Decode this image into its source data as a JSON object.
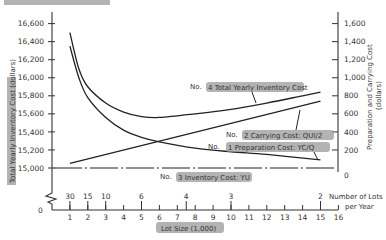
{
  "chart_data": {
    "type": "line",
    "title": "",
    "xlabel": "Lot Size (1,000)",
    "ylabel_left": "Total Yearly Inventory Cost (dollars)",
    "ylabel_right": "Preparation and Carrying Cost (dollars)",
    "x_ticks": [
      1,
      2,
      3,
      4,
      5,
      6,
      7,
      8,
      9,
      10,
      11,
      12,
      13,
      14,
      15,
      16
    ],
    "x_zero_label": "0",
    "secondary_x_label": "Number of Lots per Year",
    "secondary_x_label_line1": "Number of Lots",
    "secondary_x_label_line2": "per Year",
    "secondary_x_ticks": [
      {
        "at": 1,
        "label": "30"
      },
      {
        "at": 2,
        "label": "15"
      },
      {
        "at": 3,
        "label": "10"
      },
      {
        "at": 5,
        "label": "6"
      },
      {
        "at": 7.5,
        "label": "4"
      },
      {
        "at": 10,
        "label": "3"
      },
      {
        "at": 15,
        "label": "2"
      }
    ],
    "y_left_ticks": [
      "15,000",
      "15,200",
      "15,400",
      "15,600",
      "15,800",
      "16,000",
      "16,200",
      "16,400",
      "16,600"
    ],
    "y_left_range": [
      15000,
      16600
    ],
    "y_right_ticks": [
      "0",
      "200",
      "400",
      "600",
      "800",
      "1,000",
      "1,200",
      "1,400",
      "1,600"
    ],
    "y_right_range": [
      0,
      1600
    ],
    "series": [
      {
        "name": "No. 4 Total Yearly Inventory Cost",
        "axis": "left",
        "x": [
          1,
          1.5,
          2,
          3,
          4,
          5,
          6,
          8,
          10,
          12,
          14,
          15
        ],
        "values": [
          16500,
          16100,
          15900,
          15720,
          15620,
          15570,
          15560,
          15600,
          15650,
          15720,
          15800,
          15840
        ]
      },
      {
        "name": "No. 2 Carrying Cost: QUI/2",
        "axis": "right",
        "x": [
          1,
          15
        ],
        "values": [
          50,
          740
        ]
      },
      {
        "name": "No. 1 Preparation Cost: YC/Q",
        "axis": "right",
        "x": [
          1,
          1.5,
          2,
          3,
          4,
          5,
          6,
          8,
          10,
          12,
          15
        ],
        "values": [
          1350,
          1000,
          780,
          560,
          420,
          340,
          290,
          220,
          180,
          150,
          90
        ]
      },
      {
        "name": "No. 3 Inventory Cost: YU",
        "axis": "left",
        "x": [
          0,
          16
        ],
        "values": [
          15000,
          15000
        ]
      }
    ],
    "annotations": [
      "No. 4 Total Yearly Inventory Cost",
      "No. 2 Carrying Cost: QUI/2",
      "No. 1 Preparation Cost: YC/Q",
      "No. 3 Inventory Cost: YU"
    ],
    "grid": false,
    "legend_position": "none"
  },
  "labels": {
    "y_left_title": "Total Yearly Inventory Cost (dollars)",
    "y_right_title_line1": "Preparation and Carrying Cost",
    "y_right_title_line2": "(dollars)",
    "x_title": "Lot Size (1,000)",
    "lots_title_line1": "Number of Lots",
    "lots_title_line2": "per Year",
    "zero": "0",
    "ann_total_prefix": "No.",
    "ann_total": "4 Total Yearly Inventory Cost",
    "ann_carry_prefix": "No.",
    "ann_carry": "2 Carrying Cost: QUI/2",
    "ann_prep_prefix": "No.",
    "ann_prep": "1 Preparation Cost: YC/Q",
    "ann_inv_prefix": "No.",
    "ann_inv": "3 Inventory Cost: YU"
  },
  "colors": {
    "line": "#222222",
    "highlight": "#9a9a9a",
    "background": "#ffffff"
  }
}
